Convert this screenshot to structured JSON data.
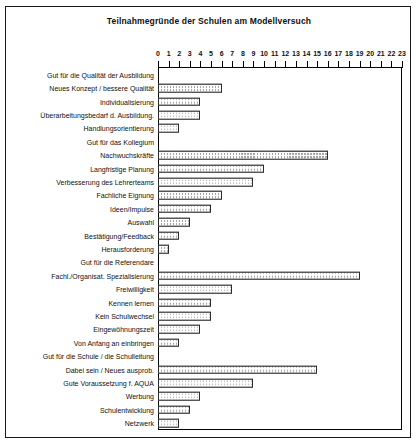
{
  "chart_data": {
    "type": "bar",
    "orientation": "horizontal",
    "title": "Teilnahmegründe der Schulen am Modellversuch",
    "xlabel": "",
    "ylabel": "",
    "xlim": [
      0,
      23
    ],
    "xticks": [
      0,
      1,
      2,
      3,
      4,
      5,
      6,
      7,
      8,
      9,
      10,
      11,
      12,
      13,
      14,
      15,
      16,
      17,
      18,
      19,
      20,
      21,
      22,
      23
    ],
    "xtick_labels": [
      "0",
      "1",
      "2",
      "3",
      "4",
      "5",
      "6",
      "7",
      "8",
      "9",
      "10",
      "11",
      "12",
      "13",
      "14",
      "15",
      "16",
      "17",
      "18",
      "19",
      "20",
      "21",
      "22",
      "23"
    ],
    "grid": false,
    "legend": false,
    "bar_fill_color": "#a8a8a8",
    "bar_edge_color": "#2b2b2b",
    "bar_pattern": "fine-checkered-gray",
    "categories": [
      "Gut für die Qualität der Ausbildung",
      "Neues Konzept / bessere Qualität",
      "Individualisierung",
      "Überarbeitungsbedarf d. Ausbildung.",
      "Handlungsorientierung",
      "Gut für das Kollegium",
      "Nachwuchskräfte",
      "Langfristige Planung",
      "Verbesserung des Lehrerteams",
      "Fachliche Eignung",
      "Ideen/Impulse",
      "Auswahl",
      "Bestätigung/Feedback",
      "Herausforderung",
      "Gut für die Referendare",
      "Fachl./Organisat. Spezialisierung",
      "Freiwilligkeit",
      "Kennen lernen",
      "Kein Schulwechsel",
      "Eingewöhnungszeit",
      "Von Anfang an einbringen",
      "Gut für die Schule / die Schulleitung",
      "Dabei sein / Neues ausprob.",
      "Gute Voraussetzung f. AQUA",
      "Werbung",
      "Schulentwicklung",
      "Netzwerk"
    ],
    "values": [
      0,
      6,
      4,
      4,
      2,
      0,
      16,
      10,
      9,
      6,
      5,
      3,
      2,
      1,
      0,
      19,
      7,
      5,
      5,
      4,
      2,
      0,
      15,
      9,
      4,
      3,
      2
    ]
  }
}
